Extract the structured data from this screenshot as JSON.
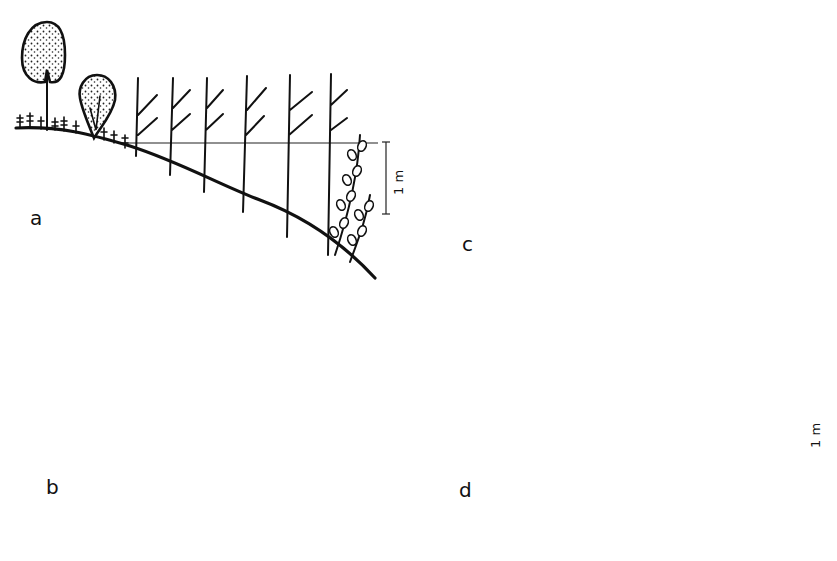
{
  "figure": {
    "panels": [
      {
        "id": "a",
        "label": "a",
        "scale_label": "1 m",
        "elements": [
          "trees",
          "shore-herbs",
          "reeds-with-leaves",
          "submerged-plants"
        ]
      },
      {
        "id": "b",
        "label": "b",
        "scale_label": "",
        "elements": [
          "grass-fringe",
          "young-reed-shoots",
          "reeds-flowering",
          "submerged-plants"
        ]
      },
      {
        "id": "c",
        "label": "c",
        "scale_label": "",
        "elements": [
          "grass-fringe",
          "small-herbs",
          "reeds-flowering",
          "submerged-plants"
        ]
      },
      {
        "id": "d",
        "label": "d",
        "scale_label": "1 m",
        "elements": [
          "grass-fringe",
          "feathery-submerged-plants",
          "submerged-plants"
        ]
      }
    ]
  },
  "colors": {
    "ink": "#111111",
    "background": "#ffffff"
  }
}
